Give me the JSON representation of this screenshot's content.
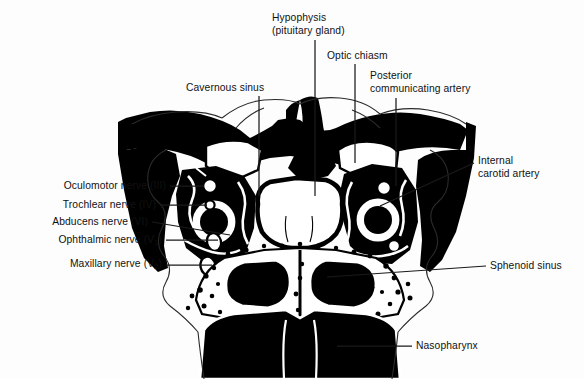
{
  "figure": {
    "background_color": "#fdfdfd",
    "ink_color": "#000000",
    "leader_line_color": "#1a1a1a",
    "labels": [
      {
        "id": "hypophysis",
        "text_line1": "Hypophysis",
        "text_line2": "(pituitary gland)",
        "side": "top",
        "x": 272,
        "y": 12,
        "leader": {
          "x1": 315,
          "y1": 40,
          "x2": 315,
          "y2": 196
        }
      },
      {
        "id": "optic-chiasm",
        "text_line1": "Optic chiasm",
        "text_line2": "",
        "side": "top",
        "x": 327,
        "y": 50,
        "leader": {
          "x1": 355,
          "y1": 64,
          "x2": 355,
          "y2": 163
        }
      },
      {
        "id": "cavernous-sinus",
        "text_line1": "Cavernous sinus",
        "text_line2": "",
        "side": "top",
        "x": 186,
        "y": 82,
        "leader": {
          "x1": 259,
          "y1": 96,
          "x2": 259,
          "y2": 196
        }
      },
      {
        "id": "posterior-communicating-artery",
        "text_line1": "Posterior",
        "text_line2": "communicating artery",
        "side": "top",
        "x": 370,
        "y": 70,
        "leader": {
          "x1": 396,
          "y1": 98,
          "x2": 396,
          "y2": 186
        }
      },
      {
        "id": "internal-carotid-artery",
        "text_line1": "Internal",
        "text_line2": "carotid artery",
        "side": "right",
        "x": 478,
        "y": 155,
        "leader": {
          "x1": 474,
          "y1": 163,
          "x2": 378,
          "y2": 205
        }
      },
      {
        "id": "sphenoid-sinus",
        "text_line1": "Sphenoid sinus",
        "text_line2": "",
        "side": "right",
        "x": 490,
        "y": 260,
        "leader": {
          "x1": 486,
          "y1": 266,
          "x2": 327,
          "y2": 277
        }
      },
      {
        "id": "nasopharynx",
        "text_line1": "Nasopharynx",
        "text_line2": "",
        "side": "bottom",
        "x": 416,
        "y": 340,
        "leader": {
          "x1": 412,
          "y1": 346,
          "x2": 337,
          "y2": 346
        }
      },
      {
        "id": "oculomotor-nerve",
        "text_line1": "Oculomotor nerve (III)",
        "text_line2": "",
        "side": "left",
        "x": 36,
        "y": 180,
        "leader": {
          "x1": 170,
          "y1": 186,
          "x2": 204,
          "y2": 186
        }
      },
      {
        "id": "trochlear-nerve",
        "text_line1": "Trochlear nerve (IV)",
        "text_line2": "",
        "side": "left",
        "x": 36,
        "y": 199,
        "leader": {
          "x1": 160,
          "y1": 205,
          "x2": 207,
          "y2": 205
        }
      },
      {
        "id": "abducens-nerve",
        "text_line1": "Abducens nerve (VI)",
        "text_line2": "",
        "side": "left",
        "x": 20,
        "y": 216,
        "leader": {
          "x1": 152,
          "y1": 222,
          "x2": 228,
          "y2": 234
        }
      },
      {
        "id": "ophthalmic-nerve",
        "text_line1": "Ophthalmic nerve (V",
        "subscript": "1",
        "text_line2": ")",
        "side": "left",
        "x": 32,
        "y": 234,
        "leader": {
          "x1": 166,
          "y1": 240,
          "x2": 218,
          "y2": 240
        }
      },
      {
        "id": "maxillary-nerve",
        "text_line1": "Maxillary nerve (V",
        "subscript": "2",
        "text_line2": ")",
        "side": "left",
        "x": 42,
        "y": 258,
        "leader": {
          "x1": 166,
          "y1": 265,
          "x2": 212,
          "y2": 265
        }
      }
    ]
  }
}
